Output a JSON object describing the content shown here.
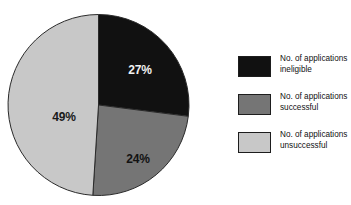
{
  "chart_data": {
    "type": "pie",
    "title": "and foundations responding to the question",
    "categories": [
      "No. of applications ineligible",
      "No. of applications successful",
      "No. of applications unsuccessful"
    ],
    "values": [
      27,
      24,
      49
    ],
    "value_labels": [
      "27%",
      "24%",
      "49%"
    ],
    "unit": "%",
    "colors": [
      "#111111",
      "#757575",
      "#c8c8c8"
    ],
    "start_angle_deg": 0,
    "direction": "clockwise",
    "legend_position": "right",
    "grid": false,
    "xlabel": "",
    "ylabel": ""
  },
  "title": {
    "text": "and foundations responding to the question"
  },
  "pie": {
    "slices": [
      {
        "name": "ineligible",
        "label": "27%",
        "percent": 27,
        "color": "#111111",
        "label_color": "#f2f2f2"
      },
      {
        "name": "successful",
        "label": "24%",
        "percent": 24,
        "color": "#757575",
        "label_color": "#121212"
      },
      {
        "name": "unsuccessful",
        "label": "49%",
        "percent": 49,
        "color": "#c8c8c8",
        "label_color": "#1a1a1a"
      }
    ]
  },
  "legend": {
    "items": [
      {
        "swatch_color": "#111111",
        "line1": "No. of applications",
        "line2": "ineligible"
      },
      {
        "swatch_color": "#757575",
        "line1": "No. of applications",
        "line2": "successful"
      },
      {
        "swatch_color": "#c8c8c8",
        "line1": "No. of applications",
        "line2": "unsuccessful"
      }
    ]
  }
}
